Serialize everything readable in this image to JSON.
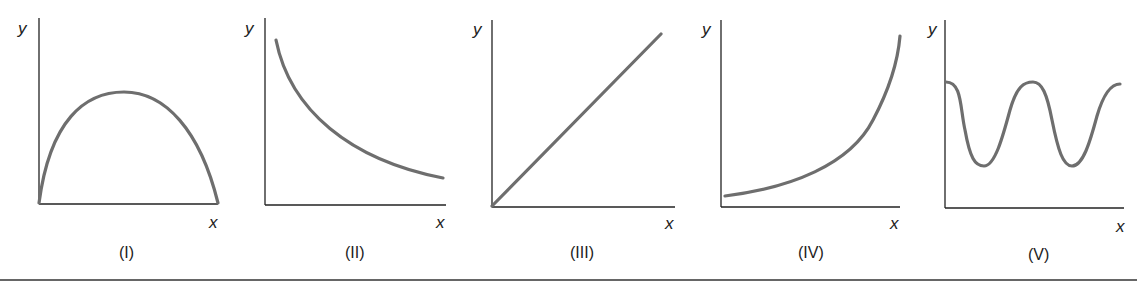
{
  "figure": {
    "panels": [
      {
        "id": "I",
        "label": "(I)",
        "xlabel": "x",
        "ylabel": "y",
        "shape": "parabola-arch (concave down, starts and ends at x-axis)"
      },
      {
        "id": "II",
        "label": "(II)",
        "xlabel": "x",
        "ylabel": "y",
        "shape": "decreasing convex (decay)"
      },
      {
        "id": "III",
        "label": "(III)",
        "xlabel": "x",
        "ylabel": "y",
        "shape": "straight line through origin, increasing"
      },
      {
        "id": "IV",
        "label": "(IV)",
        "xlabel": "x",
        "ylabel": "y",
        "shape": "increasing convex (exponential growth)"
      },
      {
        "id": "V",
        "label": "(V)",
        "xlabel": "x",
        "ylabel": "y",
        "shape": "oscillating wave"
      }
    ],
    "colors": {
      "curve": "#6e6e6e",
      "axis": "#222222"
    }
  }
}
